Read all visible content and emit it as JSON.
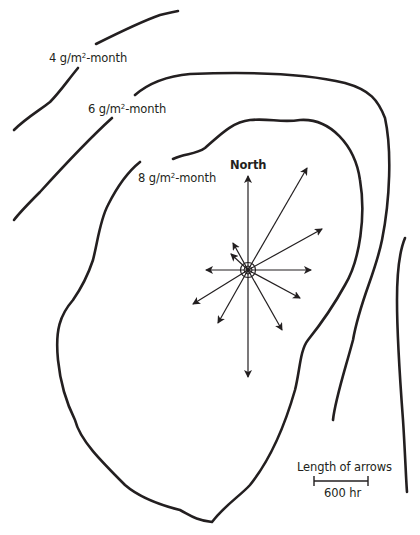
{
  "diagram": {
    "type": "isopleth map with wind rose",
    "isopleths": [
      {
        "value": "4",
        "unit_prefix": "g/m",
        "unit_sup": "2",
        "unit_suffix": "-month"
      },
      {
        "value": "6",
        "unit_prefix": "g/m",
        "unit_sup": "2",
        "unit_suffix": "-month"
      },
      {
        "value": "8",
        "unit_prefix": "g/m",
        "unit_sup": "2",
        "unit_suffix": "-month"
      }
    ],
    "wind_rose": {
      "north_label": "North",
      "center": [
        248,
        270
      ],
      "arrows": [
        {
          "direction": "N",
          "angle_deg": 0,
          "length_px": 104
        },
        {
          "direction": "NNE",
          "angle_deg": 30,
          "length_px": 106
        },
        {
          "direction": "ENE",
          "angle_deg": 62,
          "length_px": 85
        },
        {
          "direction": "E",
          "angle_deg": 90,
          "length_px": 64
        },
        {
          "direction": "ESE",
          "angle_deg": 118,
          "length_px": 58
        },
        {
          "direction": "SSE",
          "angle_deg": 152,
          "length_px": 70
        },
        {
          "direction": "S",
          "angle_deg": 180,
          "length_px": 108
        },
        {
          "direction": "SSW",
          "angle_deg": 210,
          "length_px": 60
        },
        {
          "direction": "WSW",
          "angle_deg": 240,
          "length_px": 66
        },
        {
          "direction": "W",
          "angle_deg": 270,
          "length_px": 44
        },
        {
          "direction": "WNW",
          "angle_deg": 300,
          "length_px": 24
        },
        {
          "direction": "NNW",
          "angle_deg": 330,
          "length_px": 32
        }
      ]
    },
    "scale": {
      "title": "Length of arrows",
      "value_label": "600 hr",
      "bar_length_px": 54
    }
  }
}
